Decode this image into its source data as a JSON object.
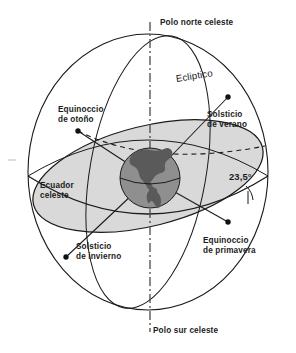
{
  "diagram": {
    "language": "es",
    "width": 296,
    "height": 353
  },
  "labels": {
    "north_pole": "Polo norte celeste",
    "south_pole": "Polo sur celeste",
    "ecliptic": "Ecliptico",
    "autumn_equinox_line1": "Equinoccio",
    "autumn_equinox_line2": "de otoño",
    "summer_solstice_line1": "Solsticio",
    "summer_solstice_line2": "de verano",
    "celestial_equator_line1": "Ecuador",
    "celestial_equator_line2": "celeste",
    "winter_solstice_line1": "Solsticio",
    "winter_solstice_line2": "de invierno",
    "spring_equinox_line1": "Equinoccio",
    "spring_equinox_line2": "de primavera",
    "obliquity_angle": "23,5°"
  },
  "colors": {
    "background": "#ffffff",
    "line": "#1b1b1b",
    "ecliptic_plane_fill": "#d9d9d9",
    "globe_ocean": "#8f8f8f",
    "globe_land": "#5a5a5a",
    "text": "#1b1b1b",
    "marker": "#111111"
  },
  "geometry": {
    "sphere_center_x": 148,
    "sphere_center_y": 172,
    "sphere_radius_x": 120,
    "sphere_radius_y": 138,
    "globe_center_x": 150,
    "globe_center_y": 178,
    "globe_radius": 30,
    "axis_top_y": 22,
    "axis_bottom_y": 332,
    "ecliptic_tilt_degrees": 23.5
  },
  "markers": [
    {
      "name": "autumn-equinox",
      "x": 78,
      "y": 131
    },
    {
      "name": "summer-solstice",
      "x": 228,
      "y": 97
    },
    {
      "name": "winter-solstice",
      "x": 66,
      "y": 257
    },
    {
      "name": "spring-equinox",
      "x": 228,
      "y": 222
    }
  ]
}
